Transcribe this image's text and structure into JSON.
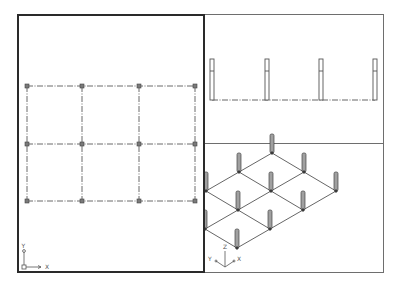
{
  "viewports": {
    "plan": {
      "name": "Top",
      "active": true,
      "ucs": {
        "x_label": "X",
        "y_label": "Y"
      }
    },
    "elevation": {
      "name": "Front",
      "active": false
    },
    "iso": {
      "name": "SE Isometric",
      "active": false,
      "ucs": {
        "x_label": "X",
        "y_label": "Y",
        "z_label": "Z"
      }
    }
  },
  "model": {
    "grid_columns": 4,
    "grid_rows": 3,
    "bays_x": 3,
    "bays_y": 2,
    "line_color": "#555555",
    "node_color": "#444444",
    "column_fill": "#9a9a9a"
  }
}
